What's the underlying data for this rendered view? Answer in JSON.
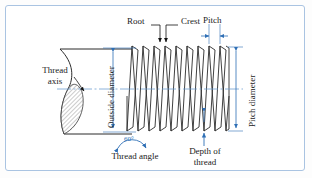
{
  "figure": {
    "type": "engineering-line-diagram",
    "border_color": "#aac4e2",
    "dimension_color": "#2f6fb5",
    "line_color": "#2b2b2b",
    "background": "#ffffff"
  },
  "labels": {
    "root": "Root",
    "crest": "Crest",
    "pitch": "Pitch",
    "thread_axis_line1": "Thread",
    "thread_axis_line2": "axis",
    "outside_diameter": "Outside diameter",
    "pitch_diameter": "Pitch diameter",
    "thread_angle_value": "60°",
    "thread_angle": "Thread angle",
    "depth_line1": "Depth of",
    "depth_line2": "thread"
  },
  "geometry": {
    "thread_count": 9,
    "thread_angle_degrees": 60,
    "axis_y": 89,
    "crest_y": 46,
    "root_y": 131,
    "thread_start_x": 127,
    "thread_end_x": 228,
    "cylinder_left_x": 60
  }
}
